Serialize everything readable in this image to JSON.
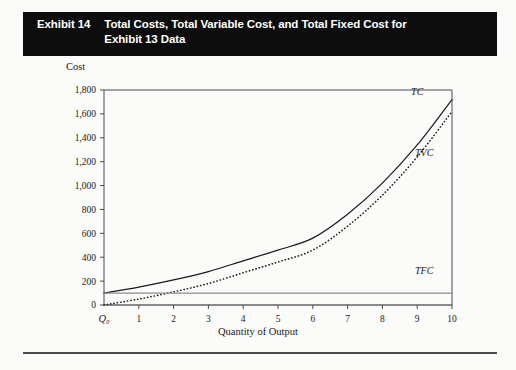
{
  "header": {
    "exhibit_label": "Exhibit 14",
    "title": "Total Costs, Total Variable Cost, and Total Fixed Cost for Exhibit 13 Data",
    "background_color": "#0d0d0d",
    "text_color": "#ffffff"
  },
  "chart_data": {
    "type": "line",
    "title": "Total Costs, Total Variable Cost, and Total Fixed Cost for Exhibit 13 Data",
    "xlabel": "Quantity of Output",
    "ylabel": "Cost",
    "origin_label": "Q₀",
    "x": [
      0,
      1,
      2,
      3,
      4,
      5,
      6,
      7,
      8,
      9,
      10
    ],
    "xticklabels": [
      "Q₀",
      "1",
      "2",
      "3",
      "4",
      "5",
      "6",
      "7",
      "8",
      "9",
      "10"
    ],
    "xlim": [
      0,
      10
    ],
    "ylim": [
      0,
      1800
    ],
    "yticks": [
      0,
      200,
      400,
      600,
      800,
      1000,
      1200,
      1400,
      1600,
      1800
    ],
    "yticklabels": [
      "0",
      "200",
      "400",
      "600",
      "800",
      "1,000",
      "1,200",
      "1,400",
      "1,600",
      "1,800"
    ],
    "grid": false,
    "legend": "inline-curve-labels",
    "series": [
      {
        "name": "TC",
        "label": "TC",
        "style": "solid",
        "color": "#1a1a1a",
        "values": [
          100,
          150,
          210,
          280,
          370,
          460,
          560,
          760,
          1020,
          1340,
          1720
        ]
      },
      {
        "name": "TVC",
        "label": "TVC",
        "style": "dotted",
        "color": "#1a1a1a",
        "values": [
          0,
          50,
          110,
          180,
          270,
          360,
          460,
          660,
          920,
          1240,
          1620
        ]
      },
      {
        "name": "TFC",
        "label": "TFC",
        "style": "solid-flat",
        "color": "#8c8c8c",
        "values": [
          100,
          100,
          100,
          100,
          100,
          100,
          100,
          100,
          100,
          100,
          100
        ]
      }
    ],
    "annotations": [
      {
        "text": "TC",
        "x": 9.0,
        "y": 1760
      },
      {
        "text": "TVC",
        "x": 9.2,
        "y": 1250
      },
      {
        "text": "TFC",
        "x": 9.2,
        "y": 260
      }
    ]
  }
}
